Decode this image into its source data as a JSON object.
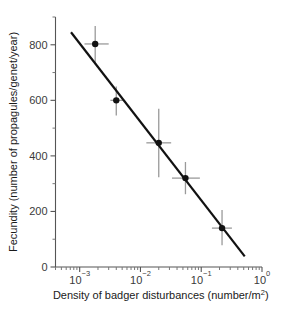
{
  "chart_data": {
    "type": "scatter",
    "title": "",
    "subtitle": "",
    "xlabel": "Density of badger disturbances (number/m²)",
    "xlabel_base": "Density of badger disturbances (number/m",
    "xlabel_sup": "2",
    "xlabel_tail": ")",
    "ylabel": "Fecundity (number of propagules/genet/year)",
    "xscale": "log",
    "yscale": "linear",
    "xlim": [
      0.0004,
      1.0
    ],
    "ylim": [
      0,
      900
    ],
    "grid": false,
    "legend": "none",
    "x_tick_labels": [
      "10⁻³",
      "10⁻²",
      "10⁻¹",
      "10⁰"
    ],
    "x_ticks": [
      0.001,
      0.01,
      0.1,
      1
    ],
    "x_tick_mantissa": [
      "10",
      "10",
      "10",
      "10"
    ],
    "x_tick_exponent": [
      "-3",
      "-2",
      "-1",
      "0"
    ],
    "y_ticks_major": [
      0,
      200,
      400,
      600,
      800
    ],
    "y_tick_labels": [
      "0",
      "200",
      "400",
      "600",
      "800"
    ],
    "y_ticks_minor": [
      100,
      300,
      500,
      700,
      900
    ],
    "series": [
      {
        "name": "Fecundity vs badger disturbance density",
        "marker": "filled-circle",
        "color": "#111111",
        "points": [
          {
            "x": 0.0018,
            "y": 803,
            "yerr_low": 735,
            "yerr_high": 868,
            "xerr_low": 0.0012,
            "xerr_high": 0.003
          },
          {
            "x": 0.004,
            "y": 600,
            "yerr_low": 545,
            "yerr_high": 650,
            "xerr_low": 0.0032,
            "xerr_high": 0.0052
          },
          {
            "x": 0.02,
            "y": 447,
            "yerr_low": 323,
            "yerr_high": 570,
            "xerr_low": 0.0125,
            "xerr_high": 0.032
          },
          {
            "x": 0.055,
            "y": 320,
            "yerr_low": 262,
            "yerr_high": 378,
            "xerr_low": 0.033,
            "xerr_high": 0.095
          },
          {
            "x": 0.22,
            "y": 140,
            "yerr_low": 78,
            "yerr_high": 205,
            "xerr_low": 0.15,
            "xerr_high": 0.32
          }
        ]
      }
    ],
    "fit_line": {
      "type": "linear-on-log-x",
      "x_start": 0.00072,
      "y_start": 845,
      "x_end": 0.52,
      "y_end": 38
    }
  }
}
